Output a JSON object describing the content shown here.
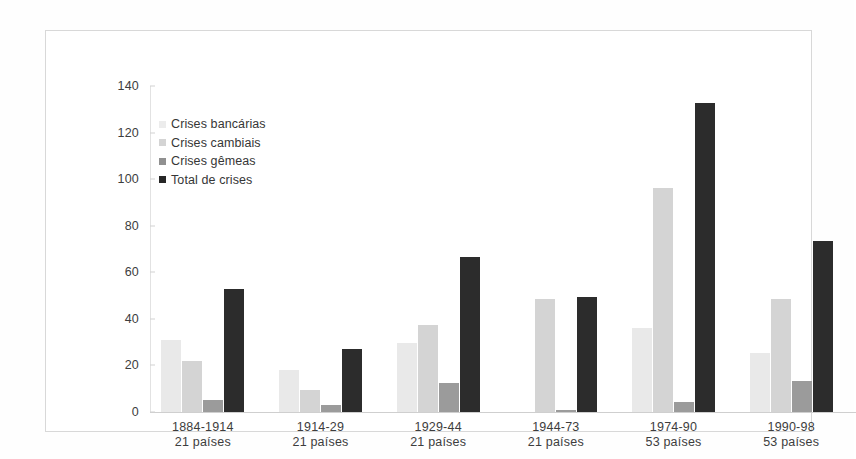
{
  "chart_data": {
    "type": "bar",
    "title": "",
    "subtitle": "",
    "xlabel": "",
    "ylabel": "",
    "ylim": [
      0,
      140
    ],
    "yticks": [
      0,
      20,
      40,
      60,
      80,
      100,
      120,
      140
    ],
    "grid": false,
    "legend_position": "top-left",
    "categories": [
      "1884-1914\n21 países",
      "1914-29\n21 países",
      "1929-44\n21 países",
      "1944-73\n21 países",
      "1974-90\n53 países",
      "1990-98\n53 países"
    ],
    "category_lines": [
      {
        "period": "1884-1914",
        "countries": "21 países"
      },
      {
        "period": "1914-29",
        "countries": "21 países"
      },
      {
        "period": "1929-44",
        "countries": "21 países"
      },
      {
        "period": "1944-73",
        "countries": "21 países"
      },
      {
        "period": "1974-90",
        "countries": "53 países"
      },
      {
        "period": "1990-98",
        "countries": "53 países"
      }
    ],
    "series": [
      {
        "name": "Crises bancárias",
        "color": "#e9e9e9",
        "values": [
          31,
          18,
          29.5,
          0,
          36,
          25.5
        ]
      },
      {
        "name": "Crises cambiais",
        "color": "#d4d4d4",
        "values": [
          22,
          9.5,
          37.5,
          48.5,
          96,
          48.5
        ]
      },
      {
        "name": "Crises gêmeas",
        "color": "#9b9b9b",
        "values": [
          5,
          3,
          12.5,
          1,
          4.5,
          13.5
        ]
      },
      {
        "name": "Total de crises",
        "color": "#2c2c2c",
        "values": [
          53,
          27,
          66.5,
          49.5,
          132.5,
          73.5
        ]
      }
    ]
  },
  "legend": {
    "items": [
      {
        "label": "Crises bancárias"
      },
      {
        "label": "Crises cambiais"
      },
      {
        "label": "Crises gêmeas"
      },
      {
        "label": "Total de crises"
      }
    ]
  },
  "colors": {
    "series_banking": "#e9e9e9",
    "series_currency": "#d4d4d4",
    "series_twin": "#9b9b9b",
    "series_total": "#2c2c2c",
    "frame_border": "#d8d8d8",
    "axis": "#cfcfcf",
    "text": "#3d3d3d",
    "background": "#ffffff"
  }
}
